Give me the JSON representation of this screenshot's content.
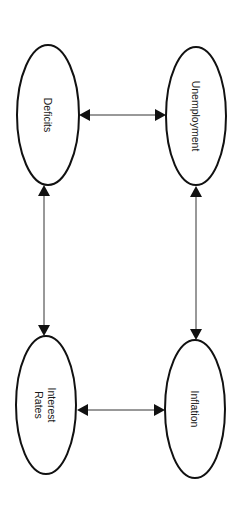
{
  "diagram": {
    "type": "causal-loop",
    "orientation": "rotated 90deg clockwise",
    "nodes": [
      {
        "id": "deficits",
        "label": "Deficits",
        "lines": [
          "Deficits"
        ],
        "cx": 48,
        "cy": 115,
        "rx": 31,
        "ry": 70
      },
      {
        "id": "unemployment",
        "label": "Unemployment",
        "lines": [
          "Unemployment"
        ],
        "cx": 196,
        "cy": 116,
        "rx": 30,
        "ry": 69
      },
      {
        "id": "interest_rates",
        "label": "Interest Rates",
        "lines": [
          "Interest",
          "Rates"
        ],
        "cx": 46,
        "cy": 405,
        "rx": 30,
        "ry": 69
      },
      {
        "id": "inflation",
        "label": "Inflation",
        "lines": [
          "Inflation"
        ],
        "cx": 195,
        "cy": 409,
        "rx": 30,
        "ry": 69
      }
    ],
    "edges": [
      {
        "from": "deficits",
        "to": "unemployment",
        "direction": "bidirectional"
      },
      {
        "from": "deficits",
        "to": "interest_rates",
        "direction": "bidirectional"
      },
      {
        "from": "unemployment",
        "to": "inflation",
        "direction": "bidirectional"
      },
      {
        "from": "interest_rates",
        "to": "inflation",
        "direction": "bidirectional"
      }
    ],
    "colors": {
      "stroke": "#111111",
      "line": "#333333",
      "background": "#ffffff"
    }
  }
}
